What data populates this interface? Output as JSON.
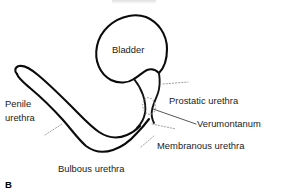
{
  "figure": {
    "panel_letter": "B",
    "background_color": "#ffffff",
    "stroke_color": "#0b0b0b",
    "leader_color": "#9a9a9a",
    "labels": {
      "bladder": "Bladder",
      "penile_urethra_line1": "Penile",
      "penile_urethra_line2": "urethra",
      "bulbous_urethra": "Bulbous urethra",
      "prostatic_urethra": "Prostatic urethra",
      "verumontanum": "Verumontanum",
      "membranous_urethra": "Membranous urethra"
    }
  }
}
